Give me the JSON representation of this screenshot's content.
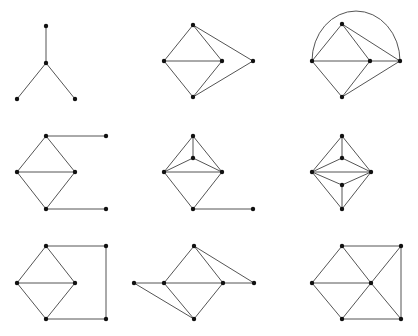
{
  "figure": {
    "colors": {
      "edge": "#555555",
      "node": "#111111",
      "background": "#ffffff"
    }
  },
  "graphs": [
    {
      "id": "graph-1",
      "nodes": [
        "top",
        "center",
        "left",
        "right"
      ],
      "edges": [
        [
          "top",
          "center"
        ],
        [
          "center",
          "left"
        ],
        [
          "center",
          "right"
        ]
      ]
    },
    {
      "id": "graph-2",
      "nodes": [
        "top",
        "left",
        "mid",
        "far",
        "bottom"
      ],
      "edges": [
        [
          "top",
          "left"
        ],
        [
          "top",
          "mid"
        ],
        [
          "top",
          "far"
        ],
        [
          "left",
          "mid"
        ],
        [
          "left",
          "bottom"
        ],
        [
          "mid",
          "bottom"
        ],
        [
          "far",
          "bottom"
        ]
      ]
    },
    {
      "id": "graph-3",
      "nodes": [
        "top",
        "left",
        "mid",
        "far",
        "bottom"
      ],
      "edges": [
        [
          "top",
          "left"
        ],
        [
          "top",
          "mid"
        ],
        [
          "top",
          "far"
        ],
        [
          "left",
          "mid"
        ],
        [
          "mid",
          "far"
        ],
        [
          "left",
          "bottom"
        ],
        [
          "mid",
          "bottom"
        ],
        [
          "far",
          "bottom"
        ]
      ],
      "arcs": [
        [
          "left",
          "far"
        ]
      ]
    },
    {
      "id": "graph-4",
      "nodes": [
        "top",
        "left",
        "right",
        "bottom",
        "top-tail",
        "bottom-tail"
      ],
      "edges": [
        [
          "top",
          "left"
        ],
        [
          "top",
          "right"
        ],
        [
          "left",
          "right"
        ],
        [
          "left",
          "bottom"
        ],
        [
          "right",
          "bottom"
        ],
        [
          "top",
          "top-tail"
        ],
        [
          "bottom",
          "bottom-tail"
        ]
      ]
    },
    {
      "id": "graph-5",
      "nodes": [
        "top",
        "inner",
        "left",
        "right",
        "bottom",
        "tail"
      ],
      "edges": [
        [
          "top",
          "left"
        ],
        [
          "top",
          "right"
        ],
        [
          "top",
          "inner"
        ],
        [
          "inner",
          "left"
        ],
        [
          "inner",
          "right"
        ],
        [
          "left",
          "right"
        ],
        [
          "left",
          "bottom"
        ],
        [
          "right",
          "bottom"
        ],
        [
          "bottom",
          "tail"
        ]
      ]
    },
    {
      "id": "graph-6",
      "nodes": [
        "top",
        "inner-top",
        "left",
        "right",
        "inner-bottom",
        "bottom"
      ],
      "edges": [
        [
          "top",
          "left"
        ],
        [
          "top",
          "right"
        ],
        [
          "top",
          "inner-top"
        ],
        [
          "inner-top",
          "left"
        ],
        [
          "inner-top",
          "right"
        ],
        [
          "left",
          "right"
        ],
        [
          "left",
          "inner-bottom"
        ],
        [
          "right",
          "inner-bottom"
        ],
        [
          "inner-bottom",
          "bottom"
        ],
        [
          "left",
          "bottom"
        ],
        [
          "right",
          "bottom"
        ]
      ]
    },
    {
      "id": "graph-7",
      "nodes": [
        "top",
        "left",
        "right",
        "bottom",
        "top-right",
        "bottom-right"
      ],
      "edges": [
        [
          "top",
          "left"
        ],
        [
          "top",
          "right"
        ],
        [
          "left",
          "right"
        ],
        [
          "left",
          "bottom"
        ],
        [
          "right",
          "bottom"
        ],
        [
          "top",
          "top-right"
        ],
        [
          "top-right",
          "bottom-right"
        ],
        [
          "bottom",
          "bottom-right"
        ]
      ]
    },
    {
      "id": "graph-8",
      "nodes": [
        "top",
        "left",
        "right",
        "far-left",
        "far-right",
        "bottom"
      ],
      "edges": [
        [
          "top",
          "left"
        ],
        [
          "top",
          "right"
        ],
        [
          "top",
          "far-right"
        ],
        [
          "far-left",
          "left"
        ],
        [
          "left",
          "right"
        ],
        [
          "right",
          "far-right"
        ],
        [
          "far-left",
          "bottom"
        ],
        [
          "left",
          "bottom"
        ],
        [
          "right",
          "bottom"
        ]
      ]
    },
    {
      "id": "graph-9",
      "nodes": [
        "top",
        "left",
        "center",
        "bottom",
        "top-right",
        "bottom-right"
      ],
      "edges": [
        [
          "top",
          "left"
        ],
        [
          "top",
          "center"
        ],
        [
          "top",
          "top-right"
        ],
        [
          "left",
          "center"
        ],
        [
          "left",
          "bottom"
        ],
        [
          "center",
          "bottom"
        ],
        [
          "center",
          "top-right"
        ],
        [
          "center",
          "bottom-right"
        ],
        [
          "top-right",
          "bottom-right"
        ],
        [
          "bottom",
          "bottom-right"
        ]
      ]
    }
  ]
}
